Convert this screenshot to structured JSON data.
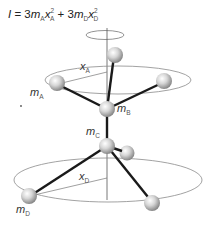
{
  "formula": {
    "I": "I",
    "eq": " = 3",
    "m": "m",
    "subA": "A",
    "x": "x",
    "sup2": "2",
    "plus": " + 3",
    "subD": "D"
  },
  "labels": {
    "xA": {
      "var": "x",
      "sub": "A"
    },
    "mA": {
      "var": "m",
      "sub": "A"
    },
    "mB": {
      "var": "m",
      "sub": "B"
    },
    "mC": {
      "var": "m",
      "sub": "C"
    },
    "xD": {
      "var": "x",
      "sub": "D"
    },
    "mD": {
      "var": "m",
      "sub": "D"
    }
  },
  "colors": {
    "bond": "#1a1a1a",
    "ring": "#888888",
    "axis": "#555555",
    "atom_light": "#f4f4f4",
    "atom_dark": "#8a8a8a"
  }
}
